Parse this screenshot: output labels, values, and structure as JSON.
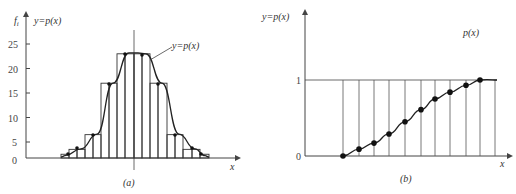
{
  "chart_data": [
    {
      "panel": "a",
      "type": "bar",
      "caption": "(a)",
      "ylabel": "f_i",
      "curve_label_top": "y=p(x)",
      "curve_label_callout": "y=p(x)",
      "xlabel": "x",
      "yticks": [
        0,
        5,
        10,
        15,
        20,
        25
      ],
      "ylim": [
        0,
        27
      ],
      "bin_edges_px": [
        61,
        69,
        77,
        85,
        93,
        101,
        109,
        117,
        125,
        134,
        142,
        150,
        158,
        167,
        175,
        183,
        192,
        200,
        209
      ],
      "values": [
        2.5,
        3.5,
        3.5,
        6.5,
        6.5,
        17,
        17,
        23,
        23,
        23,
        23,
        17,
        17,
        6.5,
        6.5,
        3.5,
        3.5,
        2.5
      ],
      "curve_points": [
        [
          65,
          2.2
        ],
        [
          81,
          3.6
        ],
        [
          97,
          6.6
        ],
        [
          113,
          17
        ],
        [
          129,
          23.2
        ],
        [
          138,
          23.2
        ],
        [
          146,
          23
        ],
        [
          162,
          17
        ],
        [
          179,
          6.6
        ],
        [
          195,
          3.6
        ],
        [
          205,
          2.2
        ]
      ],
      "grid": false
    },
    {
      "panel": "b",
      "type": "line",
      "caption": "(b)",
      "ylabel": "y=p(x)",
      "curve_label": "p(x)",
      "xlabel": "x",
      "yticks": [
        0,
        1
      ],
      "ylim": [
        0,
        1.5
      ],
      "x": [
        1,
        2,
        3,
        4,
        5,
        6,
        7,
        8,
        9,
        10
      ],
      "values": [
        0,
        0.09,
        0.17,
        0.29,
        0.45,
        0.61,
        0.75,
        0.84,
        0.93,
        1.0
      ],
      "grid": "vertical lines at each x"
    }
  ]
}
